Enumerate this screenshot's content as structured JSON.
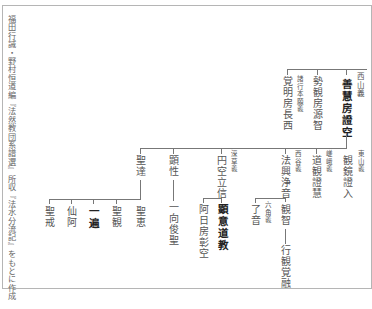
{
  "caption": "福田行誡・野村恒道編『法然教団系譜選』所収『法水分流記』をもとに作成",
  "tree": {
    "level1": [
      {
        "name": "覚明房長西",
        "annotation": "諸行本願義",
        "bold": false
      },
      {
        "name": "勢観房源智",
        "annotation": "",
        "bold": false
      },
      {
        "name": "善慧房證空",
        "annotation": "西山義",
        "bold": true
      }
    ],
    "level2": [
      {
        "name": "聖達",
        "annotation": "",
        "bold": false
      },
      {
        "name": "顕性",
        "annotation": "",
        "bold": false
      },
      {
        "name": "円空立信",
        "annotation": "深草義",
        "bold": false
      },
      {
        "name": "法興浄音",
        "annotation": "西谷義",
        "bold": false
      },
      {
        "name": "道観證慧",
        "annotation": "嵯峨義",
        "bold": false
      },
      {
        "name": "観鏡證入",
        "annotation": "東山義",
        "bold": false
      }
    ],
    "level3_under_shotatsu": [
      {
        "name": "聖戒",
        "bold": false
      },
      {
        "name": "仙阿",
        "bold": false
      },
      {
        "name": "一遍",
        "bold": true
      },
      {
        "name": "聖観",
        "bold": false
      },
      {
        "name": "聖恵",
        "bold": false
      }
    ],
    "level3_under_kensho": [
      {
        "name": "一向俊聖",
        "bold": false
      }
    ],
    "level3_under_enku": [
      {
        "name": "阿日房彰空",
        "bold": false
      },
      {
        "name": "顕意道教",
        "bold": true
      }
    ],
    "level3_under_hoko": [
      {
        "name": "了音",
        "annotation": "六角義",
        "bold": false
      },
      {
        "name": "観智",
        "bold": false
      }
    ],
    "level4_under_kanchi": [
      {
        "name": "行観覚融",
        "bold": false
      }
    ]
  },
  "colors": {
    "line": "#777777",
    "frame": "#b5b5b5",
    "text": "#555555",
    "bold_text": "#222222"
  }
}
